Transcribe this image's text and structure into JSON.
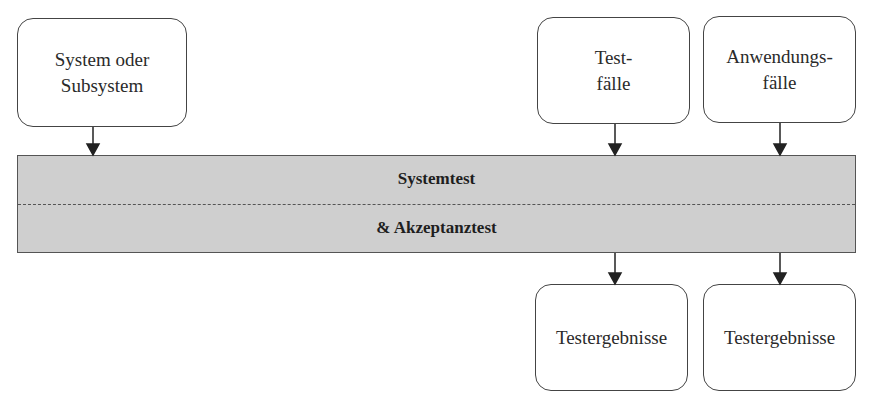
{
  "diagram": {
    "inputs": [
      {
        "id": "system",
        "lines": [
          "System oder",
          "Subsystem"
        ]
      },
      {
        "id": "testfaelle",
        "lines": [
          "Test-",
          "fälle"
        ]
      },
      {
        "id": "anwendungsfaelle",
        "lines": [
          "Anwendungs-",
          "fälle"
        ]
      }
    ],
    "process": {
      "top_label": "Systemtest",
      "bottom_label": "& Akzeptanztest",
      "fill_color": "#cfcfcf"
    },
    "outputs": [
      {
        "id": "testergebnisse-1",
        "label": "Testergebnisse"
      },
      {
        "id": "testergebnisse-2",
        "label": "Testergebnisse"
      }
    ],
    "edges": [
      {
        "from": "system",
        "to": "process"
      },
      {
        "from": "testfaelle",
        "to": "process"
      },
      {
        "from": "anwendungsfaelle",
        "to": "process"
      },
      {
        "from": "process",
        "to": "testergebnisse-1"
      },
      {
        "from": "process",
        "to": "testergebnisse-2"
      }
    ]
  }
}
